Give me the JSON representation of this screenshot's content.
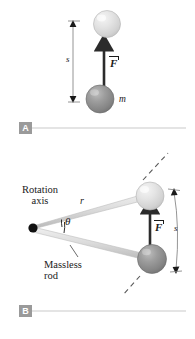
{
  "figure": {
    "panels": [
      {
        "tag": "A",
        "description": "A mass m displaced a distance s by a force F",
        "labels": {
          "displacement": "s",
          "force": "F",
          "mass": "m"
        }
      },
      {
        "tag": "B",
        "description": "A mass on a massless rod rotating about a rotation axis through angle theta, arc length s, radius r, force F",
        "labels": {
          "rotation_axis_line1": "Rotation",
          "rotation_axis_line2": "axis",
          "radius": "r",
          "angle": "θ",
          "massless_rod_line1": "Massless",
          "massless_rod_line2": "rod",
          "force": "F",
          "arc_length": "s"
        }
      }
    ]
  },
  "colors": {
    "sphere_dark": "#8c8c8c",
    "sphere_light": "#dcdcdc",
    "rod": "#d9d9d9",
    "vector": "#2b2b2b",
    "rule": "#c9c9c9",
    "tag_bg": "#9a9a9a",
    "text": "#1a1a1a"
  }
}
